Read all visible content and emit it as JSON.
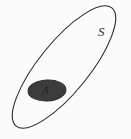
{
  "diagram": {
    "type": "set-venn-diagram",
    "background_color": "#fbfbfb",
    "universe": {
      "label": "S",
      "shape": "ellipse",
      "stroke_color": "#2a2a2a",
      "stroke_width": 1.1,
      "fill": "none",
      "center_x": 64,
      "center_y": 67,
      "radius_x": 76,
      "radius_y": 25,
      "rotation_deg": -51
    },
    "subset": {
      "label": "A",
      "shape": "ellipse",
      "fill_color": "#3c3c3c",
      "stroke_color": "#303030",
      "stroke_width": 1,
      "center_x": 47,
      "center_y": 90.5,
      "radius_x": 19,
      "radius_y": 10.5,
      "rotation_deg": -3
    },
    "labels": {
      "universe_label": "S",
      "subset_label": "A"
    }
  }
}
